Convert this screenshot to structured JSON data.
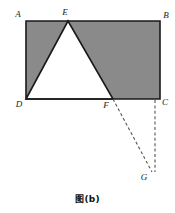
{
  "figure": {
    "caption": "图(b)",
    "type": "geometry-diagram",
    "colors": {
      "shaded_fill": "#8a8a8a",
      "unshaded_fill": "#ffffff",
      "stroke": "#1a1a1a",
      "dashed_stroke": "#555555",
      "background": "#ffffff",
      "label_color": "#1a1a1a"
    },
    "canvas": {
      "width": 175,
      "height": 213
    },
    "points": [
      {
        "name": "A",
        "label": "A",
        "x": 26,
        "y": 21,
        "label_x": 18,
        "label_y": 17
      },
      {
        "name": "B",
        "label": "B",
        "x": 160,
        "y": 21,
        "label_x": 166,
        "label_y": 18
      },
      {
        "name": "C",
        "label": "C",
        "x": 160,
        "y": 99,
        "label_x": 165,
        "label_y": 105
      },
      {
        "name": "D",
        "label": "D",
        "x": 26,
        "y": 99,
        "label_x": 19,
        "label_y": 107
      },
      {
        "name": "E",
        "label": "E",
        "x": 68,
        "y": 21,
        "label_x": 65,
        "label_y": 15
      },
      {
        "name": "F",
        "label": "F",
        "x": 113,
        "y": 99,
        "label_x": 106,
        "label_y": 108
      },
      {
        "name": "G",
        "label": "G",
        "x": 152,
        "y": 172,
        "label_x": 144,
        "label_y": 180
      }
    ],
    "shapes": {
      "rectangle": {
        "name": "rectangle-ABCD",
        "vertices": "A,B,C,D",
        "path": "M26,21 L160,21 L160,99 L26,99 Z"
      },
      "triangle": {
        "name": "triangle-DEF",
        "vertices": "D,E,F",
        "path": "M26,99 L68,21 L113,99 Z"
      }
    },
    "dashed_lines": [
      {
        "name": "segment-FG",
        "from": "F",
        "to": "G",
        "x1": 113,
        "y1": 99,
        "x2": 152,
        "y2": 172
      },
      {
        "name": "segment-CG",
        "from": "C",
        "to": "G",
        "x1": 155,
        "y1": 100,
        "x2": 155,
        "y2": 172
      }
    ]
  }
}
